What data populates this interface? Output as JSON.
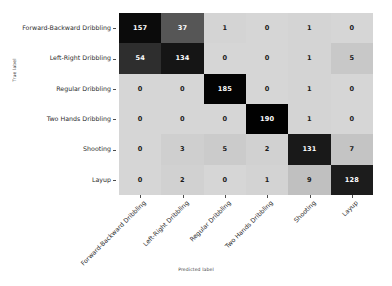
{
  "figure": {
    "background_color": "#ffffff",
    "axis_line_color": "#4d4d4d"
  },
  "axes": {
    "ylabel_title": "True label",
    "xlabel_title": "Predicted label"
  },
  "chart_data": {
    "type": "heatmap",
    "title": "",
    "subtitle": "",
    "xlabel": "Predicted label",
    "ylabel": "True label",
    "colormap": "Greys",
    "colormap_reversed_text": true,
    "grid": false,
    "legend": "none",
    "colorbar": false,
    "vmin": 0,
    "vmax": 190,
    "categories": [
      "Forward-Backward Dribbling",
      "Left-Right Dribbling",
      "Regular Dribbling",
      "Two Hands Dribbling",
      "Shooting",
      "Layup"
    ],
    "row_labels": [
      "Forward-Backward Dribbling",
      "Left-Right Dribbling",
      "Regular Dribbling",
      "Two Hands Dribbling",
      "Shooting",
      "Layup"
    ],
    "column_labels": [
      "Forward-Backward Dribbling",
      "Left-Right Dribbling",
      "Regular Dribbling",
      "Two Hands Dribbling",
      "Shooting",
      "Layup"
    ],
    "values": [
      [
        157,
        37,
        1,
        0,
        1,
        0
      ],
      [
        54,
        134,
        0,
        0,
        1,
        5
      ],
      [
        0,
        0,
        185,
        0,
        1,
        0
      ],
      [
        0,
        0,
        0,
        190,
        1,
        0
      ],
      [
        0,
        3,
        5,
        2,
        131,
        7
      ],
      [
        0,
        2,
        0,
        1,
        9,
        128
      ]
    ],
    "cell_fill_colors": [
      [
        "#0b0b0b",
        "#565656",
        "#d4d4d4",
        "#d6d6d6",
        "#d4d4d4",
        "#d6d6d6"
      ],
      [
        "#2e2e2e",
        "#151515",
        "#d6d6d6",
        "#d6d6d6",
        "#d4d4d4",
        "#c8c8c8"
      ],
      [
        "#d6d6d6",
        "#d6d6d6",
        "#030303",
        "#d6d6d6",
        "#d4d4d4",
        "#d6d6d6"
      ],
      [
        "#d6d6d6",
        "#d6d6d6",
        "#d6d6d6",
        "#010101",
        "#d4d4d4",
        "#d6d6d6"
      ],
      [
        "#d6d6d6",
        "#cfcfcf",
        "#cbcbcb",
        "#d1d1d1",
        "#191919",
        "#c4c4c4"
      ],
      [
        "#d6d6d6",
        "#d1d1d1",
        "#d6d6d6",
        "#d3d3d3",
        "#c0c0c0",
        "#1c1c1c"
      ]
    ],
    "cell_text_colors": [
      [
        "#ffffff",
        "#ffffff",
        "#1a1a1a",
        "#1a1a1a",
        "#1a1a1a",
        "#1a1a1a"
      ],
      [
        "#ffffff",
        "#ffffff",
        "#1a1a1a",
        "#1a1a1a",
        "#1a1a1a",
        "#1a1a1a"
      ],
      [
        "#1a1a1a",
        "#1a1a1a",
        "#ffffff",
        "#1a1a1a",
        "#1a1a1a",
        "#1a1a1a"
      ],
      [
        "#1a1a1a",
        "#1a1a1a",
        "#1a1a1a",
        "#ffffff",
        "#1a1a1a",
        "#1a1a1a"
      ],
      [
        "#1a1a1a",
        "#1a1a1a",
        "#1a1a1a",
        "#1a1a1a",
        "#ffffff",
        "#1a1a1a"
      ],
      [
        "#1a1a1a",
        "#1a1a1a",
        "#1a1a1a",
        "#1a1a1a",
        "#1a1a1a",
        "#ffffff"
      ]
    ]
  }
}
